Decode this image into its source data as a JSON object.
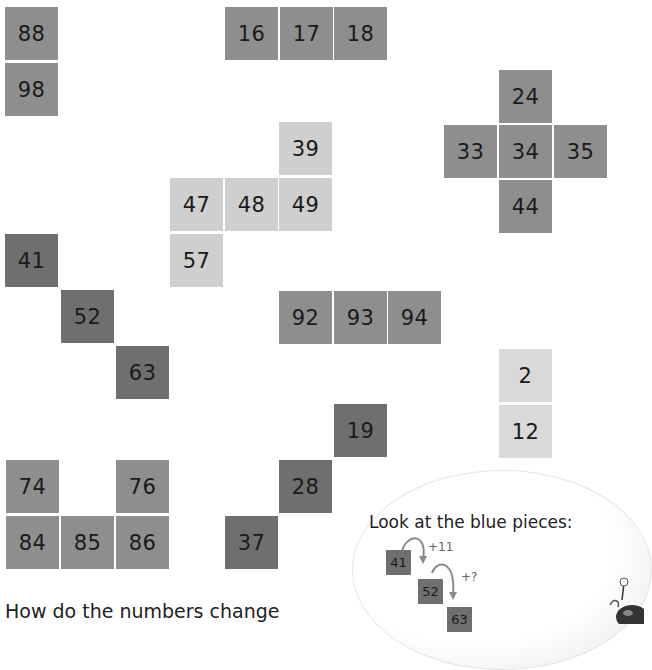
{
  "tiles": [
    {
      "value": "88",
      "group": "top-left-column"
    },
    {
      "value": "98",
      "group": "top-left-column"
    },
    {
      "value": "16",
      "group": "top-row"
    },
    {
      "value": "17",
      "group": "top-row"
    },
    {
      "value": "18",
      "group": "top-row"
    },
    {
      "value": "24",
      "group": "plus-shape"
    },
    {
      "value": "33",
      "group": "plus-shape"
    },
    {
      "value": "34",
      "group": "plus-shape"
    },
    {
      "value": "35",
      "group": "plus-shape"
    },
    {
      "value": "44",
      "group": "plus-shape"
    },
    {
      "value": "39",
      "group": "light-l-shape"
    },
    {
      "value": "47",
      "group": "light-l-shape"
    },
    {
      "value": "48",
      "group": "light-l-shape"
    },
    {
      "value": "49",
      "group": "light-l-shape"
    },
    {
      "value": "57",
      "group": "light-l-shape"
    },
    {
      "value": "41",
      "group": "blue-diagonal"
    },
    {
      "value": "52",
      "group": "blue-diagonal"
    },
    {
      "value": "63",
      "group": "blue-diagonal"
    },
    {
      "value": "92",
      "group": "middle-row"
    },
    {
      "value": "93",
      "group": "middle-row"
    },
    {
      "value": "94",
      "group": "middle-row"
    },
    {
      "value": "2",
      "group": "right-column"
    },
    {
      "value": "12",
      "group": "right-column"
    },
    {
      "value": "19",
      "group": "anti-diagonal"
    },
    {
      "value": "28",
      "group": "anti-diagonal"
    },
    {
      "value": "37",
      "group": "anti-diagonal"
    },
    {
      "value": "74",
      "group": "u-shape"
    },
    {
      "value": "76",
      "group": "u-shape"
    },
    {
      "value": "84",
      "group": "u-shape"
    },
    {
      "value": "85",
      "group": "u-shape"
    },
    {
      "value": "86",
      "group": "u-shape"
    }
  ],
  "bubble": {
    "title": "Look at the blue pieces:",
    "examples": [
      "41",
      "52",
      "63"
    ],
    "step1": "+11",
    "step2": "+?"
  },
  "question": "How do the numbers change"
}
